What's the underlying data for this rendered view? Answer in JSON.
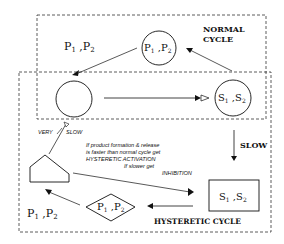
{
  "labels": {
    "normal_cycle_line1": "NORMAL",
    "normal_cycle_line2": "CYCLE",
    "hysteretic_cycle": "HYSTERETIC CYCLE",
    "slow": "SLOW",
    "very": "VERY",
    "very_slow": "SLOW",
    "products_top_left": {
      "p1": "P",
      "s1": "1",
      "sep": " ,P",
      "s2": "2"
    },
    "products_bottom_left": {
      "p1": "P",
      "s1": "1",
      "sep": " ,P",
      "s2": "2"
    },
    "circle_top": {
      "p1": "P",
      "s1": "1",
      "sep": " ,P",
      "s2": "2"
    },
    "circle_right": {
      "p1": "S",
      "s1": "1",
      "sep": " ,S",
      "s2": "2"
    },
    "box_right": {
      "p1": "S",
      "s1": "1",
      "sep": " ,S",
      "s2": "2"
    },
    "diamond": {
      "p1": "P",
      "s1": "1",
      "sep": " ,P",
      "s2": "2"
    }
  },
  "annotation": {
    "line1": "If product formation & release",
    "line2": "is faster than normal cycle get",
    "line3": "HYSTERETIC ACTIVATION",
    "line4": "If slower get",
    "line5": "INHIBITION"
  }
}
